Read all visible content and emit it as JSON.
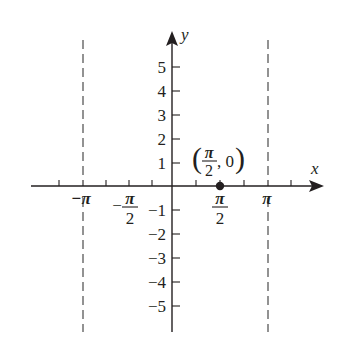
{
  "figure": {
    "type": "coordinate-plane",
    "axes": {
      "x_label": "x",
      "y_label": "y",
      "x_tick_labels": [
        {
          "text": "−π",
          "value": "-pi"
        },
        {
          "num": "π",
          "den": "2",
          "sign": "−",
          "value": "-pi/2"
        },
        {
          "num": "π",
          "den": "2",
          "sign": "",
          "value": "pi/2"
        },
        {
          "text": "π",
          "value": "pi"
        }
      ],
      "y_tick_labels": [
        "5",
        "4",
        "3",
        "2",
        "1",
        "−1",
        "−2",
        "−3",
        "−4",
        "−5"
      ],
      "y_range": [
        -5,
        5
      ],
      "x_minor_ticks_per_pi": 4
    },
    "asymptotes": [
      {
        "x": "-pi",
        "style": "dashed"
      },
      {
        "x": "pi",
        "style": "dashed"
      }
    ],
    "points": [
      {
        "label_open": "(",
        "label_num": "π",
        "label_den": "2",
        "label_rest": ", 0",
        "label_close": ")",
        "x": "pi/2",
        "y": 0
      }
    ]
  },
  "colors": {
    "ink": "#231f20",
    "background": "#ffffff"
  }
}
